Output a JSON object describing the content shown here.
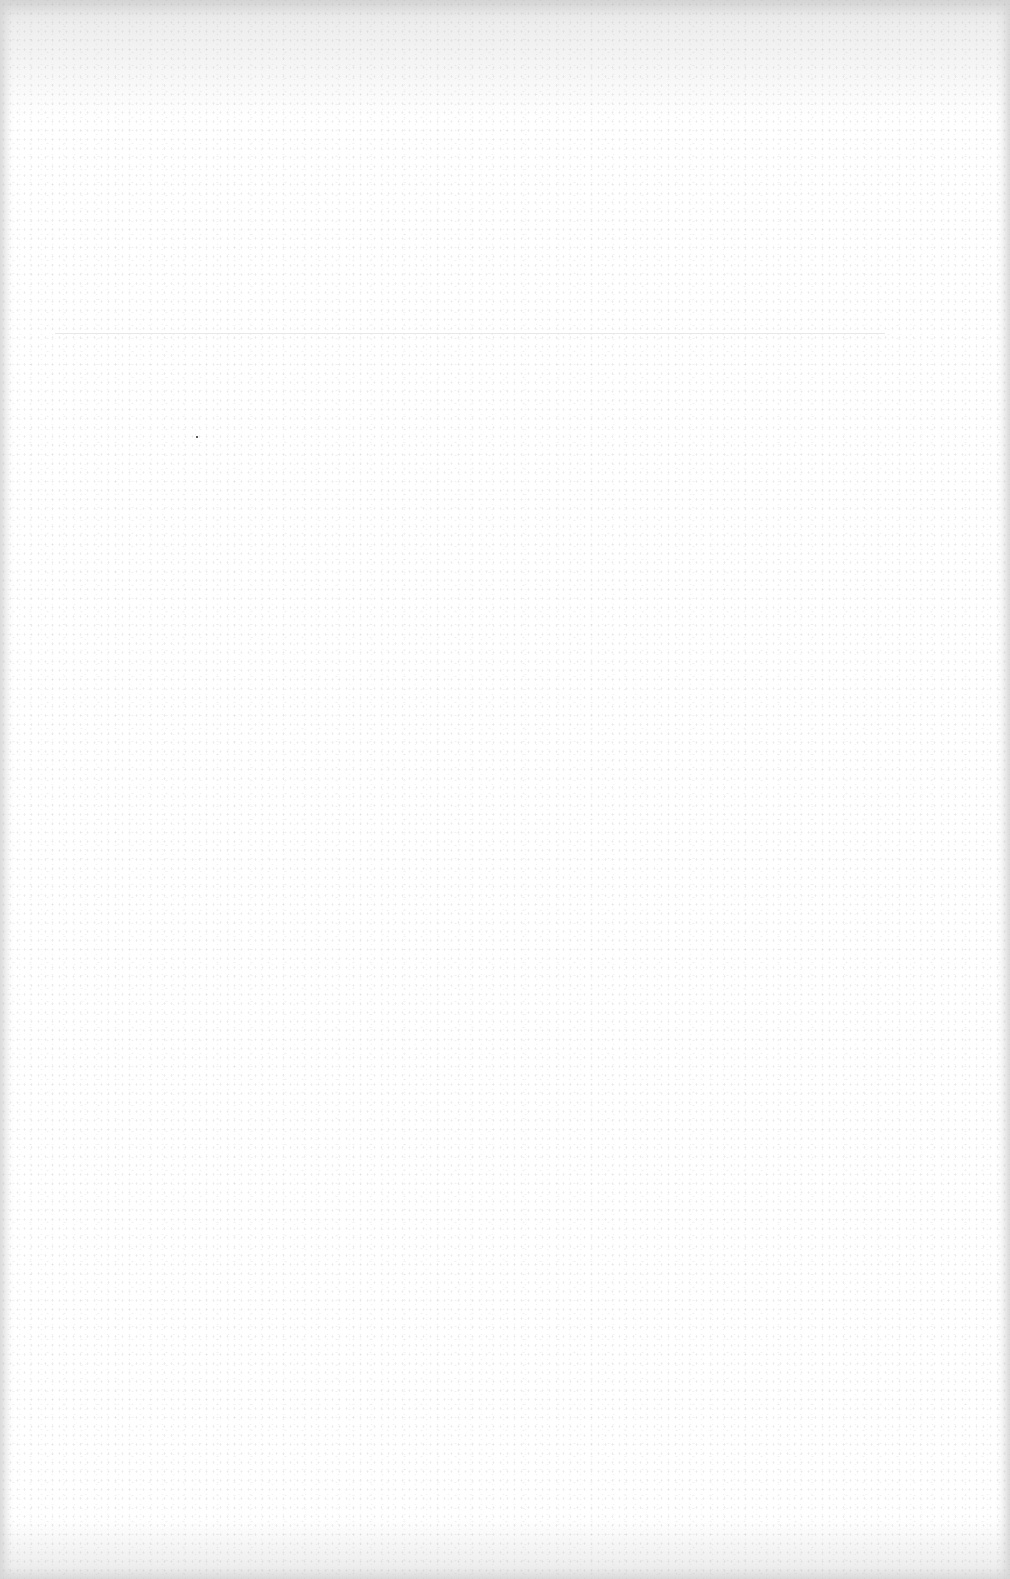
{
  "document": {
    "type": "blank scanned page",
    "text_content": "",
    "colors": {
      "paper": "#ffffff",
      "scan_edge": "#e9e9e9",
      "faint_rule": "#e2e2e2",
      "speck": "#222222"
    }
  }
}
